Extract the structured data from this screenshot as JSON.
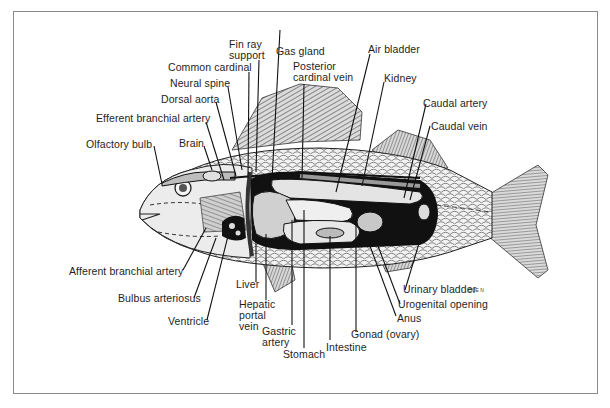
{
  "figure": {
    "artist_signature": "OUE N",
    "colors": {
      "frame": "#8a8a8a",
      "label_text": "#1e1e1e",
      "leader_lines": "#111111",
      "body_light": "#e6e6e6",
      "cavity_dark": "#111111"
    }
  },
  "labels": {
    "fin_ray_support": [
      "Fin ray",
      "support"
    ],
    "gas_gland": "Gas gland",
    "common_cardinal": "Common cardinal",
    "posterior_cardinal_vein": [
      "Posterior",
      "cardinal vein"
    ],
    "air_bladder": "Air bladder",
    "neural_spine": "Neural spine",
    "kidney": "Kidney",
    "dorsal_aorta": "Dorsal aorta",
    "caudal_artery": "Caudal artery",
    "efferent_branchial_artery": "Efferent branchial artery",
    "caudal_vein": "Caudal vein",
    "olfactory_bulb": "Olfactory bulb",
    "brain": "Brain",
    "afferent_branchial_artery": "Afferent branchial artery",
    "bulbus_arteriosus": "Bulbus arteriosus",
    "ventricle": "Ventricle",
    "liver": "Liver",
    "hepatic_portal_vein": [
      "Hepatic",
      "portal",
      "vein"
    ],
    "gastric_artery": [
      "Gastric",
      "artery"
    ],
    "stomach": "Stomach",
    "intestine": "Intestine",
    "gonad_ovary": "Gonad (ovary)",
    "anus": "Anus",
    "urogenital_opening": "Urogenital opening",
    "urinary_bladder": "Urinary bladder"
  }
}
